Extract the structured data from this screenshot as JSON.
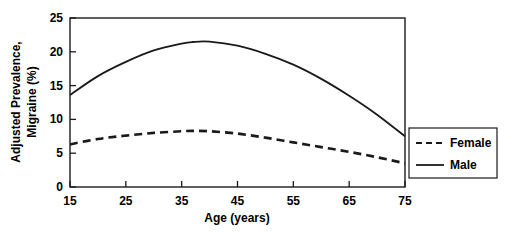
{
  "chart_data": {
    "type": "line",
    "title": "",
    "xlabel": "Age (years)",
    "ylabel": "Adjusted Prevalence, Migraine (%)",
    "ylabel_line1": "Adjusted Prevalence,",
    "ylabel_line2": "Migraine (%)",
    "xlim": [
      15,
      75
    ],
    "ylim": [
      0,
      25
    ],
    "xticks": [
      15,
      25,
      35,
      45,
      55,
      65,
      75
    ],
    "xtick_labels": [
      "15",
      "25",
      "35",
      "45",
      "55",
      "65",
      "75"
    ],
    "yticks": [
      0,
      5,
      10,
      15,
      20,
      25
    ],
    "ytick_labels": [
      "0",
      "5",
      "10",
      "15",
      "20",
      "25"
    ],
    "grid": false,
    "legend_position": "right-outside",
    "x": [
      15,
      20,
      25,
      30,
      35,
      37,
      40,
      45,
      50,
      55,
      60,
      65,
      70,
      75
    ],
    "series": [
      {
        "name": "Female",
        "style": "dashed",
        "color": "#1a1a1a",
        "values": [
          6.3,
          7.1,
          7.6,
          8.0,
          8.25,
          8.3,
          8.25,
          7.9,
          7.3,
          6.6,
          5.9,
          5.2,
          4.4,
          3.5
        ]
      },
      {
        "name": "Male",
        "style": "solid",
        "color": "#1a1a1a",
        "values": [
          13.6,
          16.4,
          18.5,
          20.2,
          21.2,
          21.45,
          21.5,
          20.9,
          19.7,
          18.1,
          16.0,
          13.5,
          10.7,
          7.5
        ]
      }
    ]
  },
  "legend": {
    "items": [
      {
        "label": "Female",
        "style": "dashed"
      },
      {
        "label": "Male",
        "style": "solid"
      }
    ]
  },
  "axes": {
    "x_axis_title": "Age (years)",
    "y_axis_title_line1": "Adjusted Prevalence,",
    "y_axis_title_line2": "Migraine (%)"
  },
  "colors": {
    "line": "#1a1a1a",
    "axis": "#1a1a1a",
    "background": "#ffffff",
    "text": "#000000"
  }
}
